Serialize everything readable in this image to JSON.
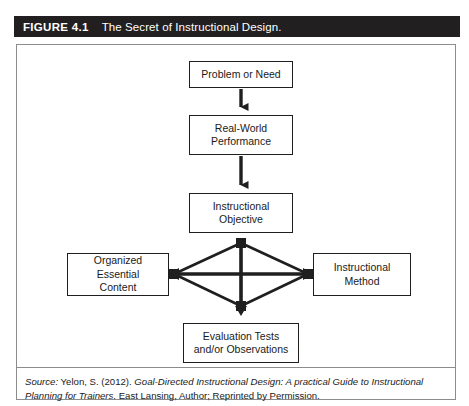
{
  "header": {
    "figure_number": "FIGURE 4.1",
    "title": "The Secret of Instructional Design.",
    "background_color": "#211f1f",
    "text_color": "#ffffff"
  },
  "diagram": {
    "type": "flowchart",
    "nodes": [
      {
        "id": "problem",
        "label": "Problem or Need"
      },
      {
        "id": "performance",
        "label": "Real-World\nPerformance",
        "line1": "Real-World",
        "line2": "Performance"
      },
      {
        "id": "objective",
        "label": "Instructional\nObjective",
        "line1": "Instructional",
        "line2": "Objective"
      },
      {
        "id": "content",
        "label": "Organized Essential\nContent",
        "line1": "Organized Essential",
        "line2": "Content"
      },
      {
        "id": "method",
        "label": "Instructional Method"
      },
      {
        "id": "evaluation",
        "label": "Evaluation Tests\nand/or Observations",
        "line1": "Evaluation Tests",
        "line2": "and/or Observations"
      }
    ],
    "connectors": [
      {
        "from": "problem",
        "to": "performance",
        "style": "single-arrow-down"
      },
      {
        "from": "performance",
        "to": "objective",
        "style": "single-arrow-down"
      },
      {
        "from": "objective",
        "to": "evaluation",
        "style": "double-arrow-vertical"
      },
      {
        "from": "content",
        "to": "method",
        "style": "double-arrow-horizontal"
      },
      {
        "from": "objective",
        "to": "content",
        "style": "diamond-edge"
      },
      {
        "from": "objective",
        "to": "method",
        "style": "diamond-edge"
      },
      {
        "from": "content",
        "to": "evaluation",
        "style": "diamond-edge"
      },
      {
        "from": "method",
        "to": "evaluation",
        "style": "diamond-edge"
      }
    ],
    "line_color": "#1f1f1f",
    "box_border_color": "#1f1f1f"
  },
  "source": {
    "label": "Source:",
    "citation_author": " Yelon, S. (2012). ",
    "citation_title": "Goal-Directed Instructional Design: A practical Guide to Instructional Planning for Trainers",
    "citation_tail": ". East Lansing, Author; Reprinted by Permission."
  }
}
